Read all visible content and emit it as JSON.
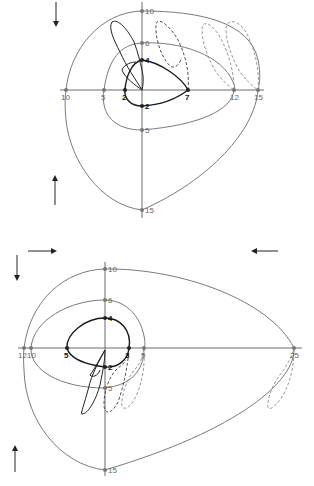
{
  "diagrams": [
    {
      "id": "upper",
      "axis_labels": {
        "top_outer": "10",
        "top_mid": "6",
        "top_inner": "4",
        "left_outer": "10",
        "left_mid": "5",
        "left_inner": "2",
        "right_inner": "7",
        "right_mid": "12",
        "right_outer": "15",
        "bottom_inner": "2",
        "bottom_mid": "5",
        "bottom_outer": "15"
      },
      "arrows": [
        "down",
        "up"
      ]
    },
    {
      "id": "lower",
      "axis_labels": {
        "top_outer": "10",
        "top_mid": "6",
        "top_inner": "4",
        "left_outer": "12",
        "left_mid": "10",
        "left_inner": "5",
        "right_inner": "3",
        "right_mid": "5",
        "right_outer": "25",
        "bottom_inner": "2",
        "bottom_mid": "5",
        "bottom_outer": "15"
      },
      "arrows": [
        "right",
        "left",
        "down",
        "up"
      ]
    }
  ],
  "colors": {
    "loop": "#1a1a1a",
    "scale": "#7a7a7a",
    "dashed": "#3a3a3a"
  }
}
